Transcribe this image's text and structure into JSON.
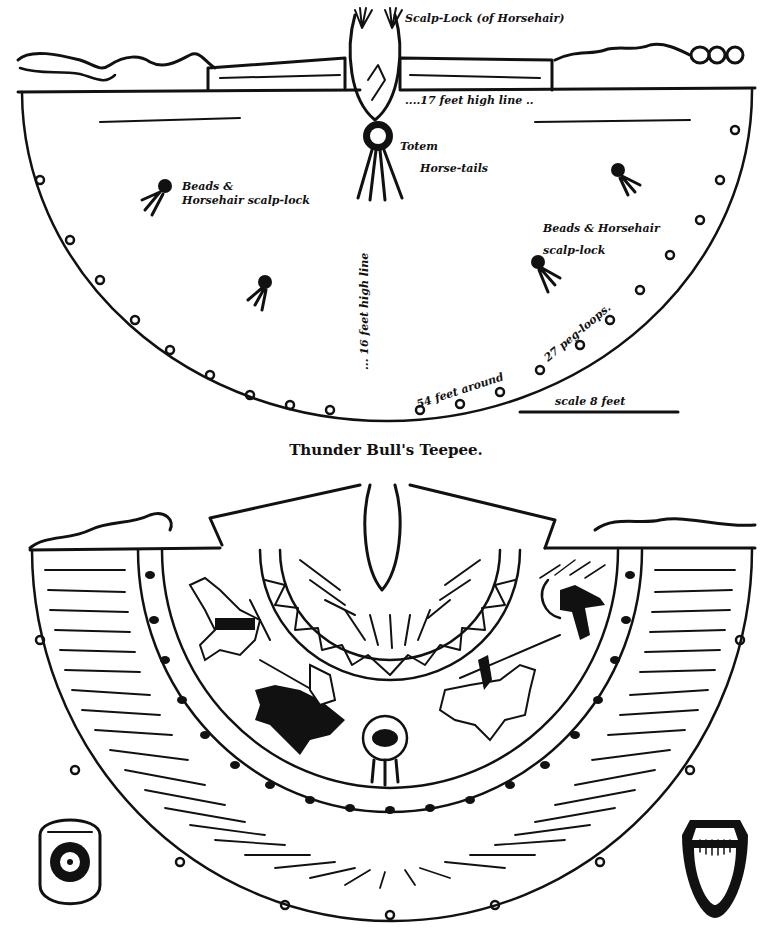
{
  "figure": {
    "caption": "Thunder Bull's Teepee."
  },
  "top_diagram": {
    "labels": {
      "scalp_lock": "Scalp-Lock (of Horsehair)",
      "height_line_top": "....17 feet high line ..",
      "totem": "Totem",
      "horse_tails": "Horse-tails",
      "beads_left_1": "Beads &",
      "beads_left_2": "Horsehair scalp-lock",
      "beads_right_1": "Beads & Horsehair",
      "beads_right_2": "scalp-lock",
      "height_line_center": "... 16 feet high line",
      "peg_loops": "27 peg-loops.",
      "circumference": "54 feet around",
      "scale": "scale 8 feet"
    }
  },
  "bottom_diagram": {
    "elements": [
      "spotted-horse",
      "warrior-on-black-horse",
      "buffalo-shield",
      "warrior-with-lance-on-horse",
      "warrior-with-bow",
      "zigzag-band",
      "dot-band"
    ],
    "left_ornament": "sun-medallion-shield",
    "right_ornament": "fringed-pouch"
  },
  "colors": {
    "ink": "#111111",
    "paper": "#ffffff"
  }
}
